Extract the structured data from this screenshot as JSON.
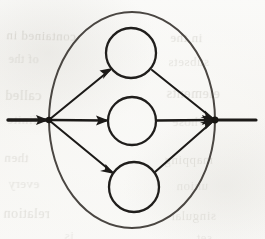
{
  "page": {
    "width": 265,
    "height": 239,
    "background_color": "#fbfbfa",
    "ink_color": "#1c1a18",
    "outline_color": "#4a4642",
    "ghost_text_color": "#b9b6ad",
    "media": "scanned-book-page"
  },
  "figure": {
    "label": ""
  },
  "chart_data": {
    "type": "diagram",
    "title": "",
    "nodes": [
      {
        "id": "entry-tail",
        "name": "entry-edge-start",
        "shape": "line-end",
        "cx": 8,
        "cy": 120,
        "r": 0
      },
      {
        "id": "left-vertex",
        "name": "left-junction-vertex",
        "shape": "vertex",
        "cx": 49,
        "cy": 120,
        "r": 3.2
      },
      {
        "id": "node-top",
        "name": "top-circle-node",
        "shape": "circle",
        "cx": 131,
        "cy": 53,
        "r": 25
      },
      {
        "id": "node-middle",
        "name": "middle-circle-node",
        "shape": "circle",
        "cx": 132,
        "cy": 121,
        "r": 24
      },
      {
        "id": "node-bottom",
        "name": "bottom-circle-node",
        "shape": "circle",
        "cx": 134,
        "cy": 187,
        "r": 25
      },
      {
        "id": "right-vertex",
        "name": "right-junction-vertex",
        "shape": "vertex",
        "cx": 215,
        "cy": 120,
        "r": 3.4
      },
      {
        "id": "exit-head",
        "name": "exit-edge-end",
        "shape": "line-end",
        "cx": 256,
        "cy": 120,
        "r": 0
      }
    ],
    "edges": [
      {
        "id": "e-entry",
        "name": "entry-arrow",
        "from": "entry-tail",
        "to": "left-vertex",
        "arrow": true,
        "style": "straight",
        "weight": 3.4
      },
      {
        "id": "e-left-top",
        "name": "left-to-top-arrow",
        "from": "left-vertex",
        "to": "node-top",
        "arrow": true,
        "style": "straight",
        "weight": 2.1
      },
      {
        "id": "e-left-mid",
        "name": "left-to-middle-arrow",
        "from": "left-vertex",
        "to": "node-middle",
        "arrow": true,
        "style": "straight",
        "weight": 2.3
      },
      {
        "id": "e-left-bot",
        "name": "left-to-bottom-arrow",
        "from": "left-vertex",
        "to": "node-bottom",
        "arrow": true,
        "style": "straight",
        "weight": 2.1
      },
      {
        "id": "e-top-right",
        "name": "top-to-right-arrow",
        "from": "node-top",
        "to": "right-vertex",
        "arrow": true,
        "style": "straight",
        "weight": 2.1
      },
      {
        "id": "e-mid-right",
        "name": "middle-to-right-arrow",
        "from": "node-middle",
        "to": "right-vertex",
        "arrow": true,
        "style": "straight",
        "weight": 2.3
      },
      {
        "id": "e-bot-right",
        "name": "bottom-to-right-arrow",
        "from": "node-bottom",
        "to": "right-vertex",
        "arrow": true,
        "style": "straight",
        "weight": 2.1
      },
      {
        "id": "e-exit",
        "name": "exit-line",
        "from": "right-vertex",
        "to": "exit-head",
        "arrow": false,
        "style": "straight",
        "weight": 3.2
      }
    ],
    "enclosure": {
      "id": "outer-ellipse",
      "name": "outer-boundary-ellipse",
      "shape": "ellipse",
      "cx": 132,
      "cy": 120,
      "rx": 83,
      "ry": 108,
      "stroke_width": 2.0
    },
    "legend": [],
    "annotations": []
  },
  "ghost_text": {
    "description": "Faint mirrored show-through text from the reverse side of the scanned page",
    "lines": [
      {
        "text": "contained in",
        "x": 6,
        "y": 28,
        "size": 13,
        "rotate": -1.2,
        "opacity": 0.42
      },
      {
        "text": "in the",
        "x": 170,
        "y": 30,
        "size": 13,
        "rotate": -0.8,
        "opacity": 0.36
      },
      {
        "text": "of the",
        "x": 8,
        "y": 52,
        "size": 12,
        "rotate": -1.0,
        "opacity": 0.34
      },
      {
        "text": "subsets",
        "x": 168,
        "y": 54,
        "size": 13,
        "rotate": 0.6,
        "opacity": 0.3
      },
      {
        "text": "called",
        "x": 5,
        "y": 88,
        "size": 14,
        "rotate": -0.6,
        "opacity": 0.4
      },
      {
        "text": "elements",
        "x": 166,
        "y": 86,
        "size": 14,
        "rotate": -0.4,
        "opacity": 0.38
      },
      {
        "text": "finite",
        "x": 7,
        "y": 112,
        "size": 13,
        "rotate": -0.9,
        "opacity": 0.3
      },
      {
        "text": "whose",
        "x": 172,
        "y": 114,
        "size": 13,
        "rotate": 0.5,
        "opacity": 0.28
      },
      {
        "text": "then",
        "x": 4,
        "y": 150,
        "size": 13,
        "rotate": -1.1,
        "opacity": 0.34
      },
      {
        "text": "mapping",
        "x": 164,
        "y": 152,
        "size": 13,
        "rotate": 0.4,
        "opacity": 0.3
      },
      {
        "text": "every",
        "x": 8,
        "y": 176,
        "size": 13,
        "rotate": -0.7,
        "opacity": 0.3
      },
      {
        "text": "union",
        "x": 176,
        "y": 178,
        "size": 13,
        "rotate": 0.8,
        "opacity": 0.26
      },
      {
        "text": "relation",
        "x": 3,
        "y": 206,
        "size": 14,
        "rotate": -0.5,
        "opacity": 0.36
      },
      {
        "text": "singular",
        "x": 170,
        "y": 208,
        "size": 13,
        "rotate": 0.6,
        "opacity": 0.3
      },
      {
        "text": "is",
        "x": 64,
        "y": 228,
        "size": 13,
        "rotate": -0.4,
        "opacity": 0.24
      },
      {
        "text": "set",
        "x": 196,
        "y": 230,
        "size": 13,
        "rotate": 0.5,
        "opacity": 0.24
      }
    ]
  }
}
